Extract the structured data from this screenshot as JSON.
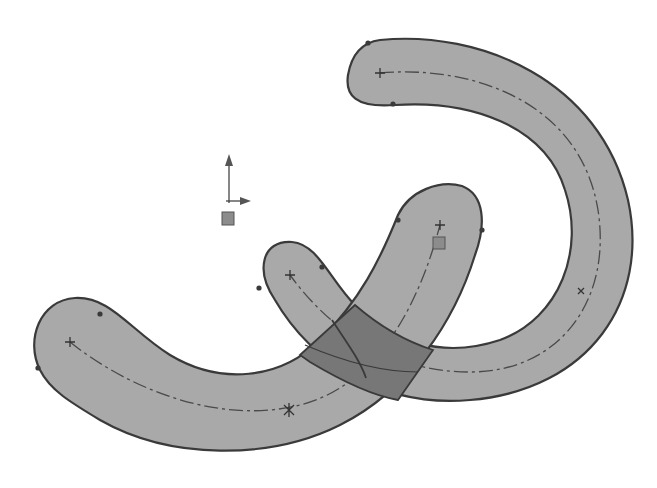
{
  "scene": {
    "title": "Sketch - overlapping slots",
    "background": "#ffffff",
    "colors": {
      "slot_fill": "#a9a9a9",
      "overlap_fill": "#777777",
      "outline": "#3a3a3a",
      "centerline": "#4a4a4a"
    },
    "entities": [
      {
        "name": "slot-arc-right",
        "type": "arc-slot"
      },
      {
        "name": "slot-arc-left",
        "type": "arc-slot"
      },
      {
        "name": "overlap-region",
        "type": "intersection"
      },
      {
        "name": "origin-triad",
        "type": "coordinate-system"
      }
    ]
  }
}
